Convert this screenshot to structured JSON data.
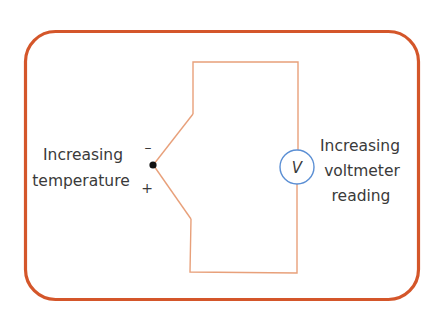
{
  "diagram": {
    "type": "thermocouple-circuit",
    "left_label": {
      "line1": "Increasing",
      "line2": "temperature"
    },
    "junction_signs": {
      "top": "–",
      "bottom": "+"
    },
    "meter": {
      "symbol": "V",
      "name": "voltmeter"
    },
    "right_label": {
      "line1": "Increasing",
      "line2": "voltmeter",
      "line3": "reading"
    }
  },
  "colors": {
    "frame": "#d4562a",
    "wire": "#e8a07a",
    "meter_circle": "#5b8fd4",
    "junction": "#111111",
    "text": "#3a3a3a"
  }
}
